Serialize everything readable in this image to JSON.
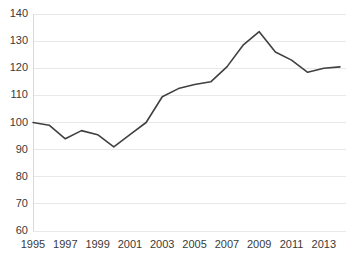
{
  "chart_data": {
    "type": "line",
    "title": "",
    "subtitle": "",
    "xlabel": "",
    "ylabel": "",
    "xlim": [
      1995,
      2014
    ],
    "ylim": [
      60,
      140
    ],
    "ytick_step": 10,
    "xtick_step": 2,
    "grid": true,
    "grid_axis": "y",
    "legend": false,
    "legend_position": "none",
    "line_color": "#404040",
    "grid_color": "#e8e8e8",
    "background_color": "#ffffff",
    "text_color": "#3a3a3a",
    "yticks": [
      60,
      70,
      80,
      90,
      100,
      110,
      120,
      130,
      140
    ],
    "ytick_labels": [
      "60",
      "70",
      "80",
      "90",
      "100",
      "110",
      "120",
      "130",
      "140"
    ],
    "xticks": [
      1995,
      1997,
      1999,
      2001,
      2003,
      2005,
      2007,
      2009,
      2011,
      2013
    ],
    "xtick_labels": [
      "1995",
      "1997",
      "1999",
      "2001",
      "2003",
      "2005",
      "2007",
      "2009",
      "2011",
      "2013"
    ],
    "x": [
      1995,
      1996,
      1997,
      1998,
      1999,
      2000,
      2001,
      2002,
      2003,
      2004,
      2005,
      2006,
      2007,
      2008,
      2009,
      2010,
      2011,
      2012,
      2013,
      2014
    ],
    "series": [
      {
        "name": "Index",
        "values": [
          100.0,
          99.0,
          94.0,
          97.0,
          95.5,
          91.0,
          95.5,
          100.0,
          109.5,
          112.5,
          114.0,
          115.0,
          120.5,
          128.5,
          133.5,
          126.0,
          123.0,
          118.5,
          120.0,
          120.5
        ]
      }
    ],
    "annotations": []
  }
}
